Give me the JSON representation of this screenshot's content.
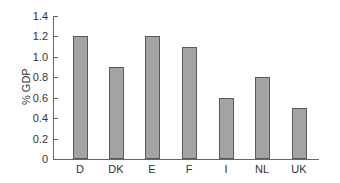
{
  "chart_data": {
    "type": "bar",
    "title": "",
    "xlabel": "",
    "ylabel": "% GDP",
    "categories": [
      "D",
      "DK",
      "E",
      "F",
      "I",
      "NL",
      "UK"
    ],
    "values": [
      1.2,
      0.9,
      1.2,
      1.1,
      0.6,
      0.8,
      0.5
    ],
    "ylim": [
      0,
      1.4
    ],
    "yticks": [
      "0",
      "0.2",
      "0.4",
      "0.6",
      "0.8",
      "1.0",
      "1.2",
      "1.4"
    ],
    "grid": false,
    "legend": null,
    "colors": {
      "bar_fill": "#a3a3a3",
      "bar_edge": "#5a5a5a",
      "axis": "#666666"
    }
  }
}
